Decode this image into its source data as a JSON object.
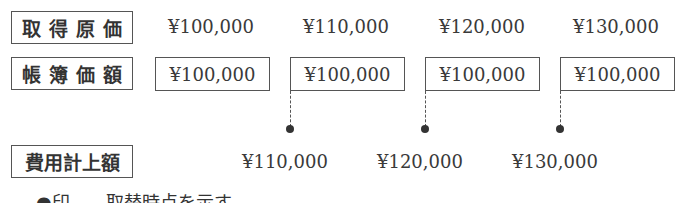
{
  "rows": {
    "acquisition_cost": {
      "label": "取得原価",
      "values": [
        "¥100,000",
        "¥110,000",
        "¥120,000",
        "¥130,000"
      ]
    },
    "book_value": {
      "label": "帳簿価額",
      "values": [
        "¥100,000",
        "¥100,000",
        "¥100,000",
        "¥100,000"
      ]
    },
    "expense_recorded": {
      "label": "費用計上額",
      "values": [
        "¥110,000",
        "¥120,000",
        "¥130,000"
      ]
    }
  },
  "note": {
    "marker": "●",
    "text": "印……取替時点を示す"
  }
}
